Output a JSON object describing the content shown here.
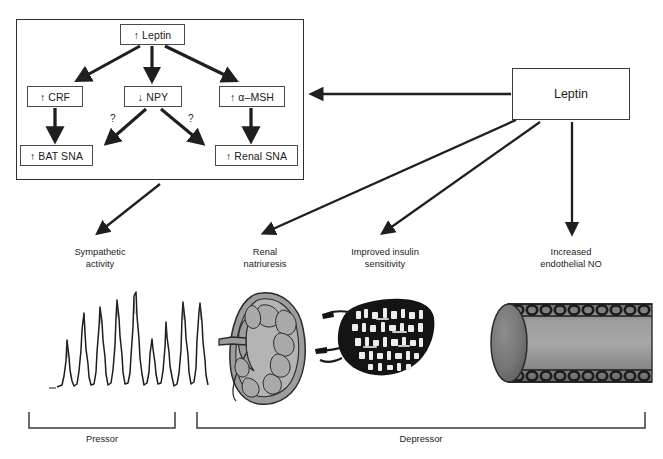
{
  "diagram": {
    "title_hidden": "",
    "central_node": {
      "label": "Leptin"
    },
    "flowchart": {
      "top_node": {
        "label": "↑ Leptin"
      },
      "mid_nodes": [
        {
          "label": "↑ CRF"
        },
        {
          "label": "↓ NPY"
        },
        {
          "label": "↑ α–MSH"
        }
      ],
      "bottom_nodes": [
        {
          "label": "↑ BAT SNA"
        },
        {
          "label": "↑ Renal SNA"
        }
      ],
      "uncertainty_marks": [
        {
          "label": "?"
        },
        {
          "label": "?"
        }
      ]
    },
    "outcomes": [
      {
        "line1": "Sympathetic",
        "line2": "activity",
        "figure": "sympathetic-nerve-activity-trace"
      },
      {
        "line1": "Renal",
        "line2": "natriuresis",
        "figure": "kidney-illustration"
      },
      {
        "line1": "Improved insulin",
        "line2": "sensitivity",
        "figure": "pancreatic-islet-micrograph"
      },
      {
        "line1": "Increased",
        "line2": "endothelial NO",
        "figure": "blood-vessel-illustration"
      }
    ],
    "brackets": [
      {
        "label": "Pressor"
      },
      {
        "label": "Depressor"
      }
    ],
    "colors": {
      "stroke": "#2f2f2f",
      "box_border": "#4a4a4a",
      "text": "#1a1a1a",
      "bracket": "#3a3a3a",
      "kidney_fill": "#9b9b9b",
      "vessel_fill": "#8f8f8f"
    }
  }
}
